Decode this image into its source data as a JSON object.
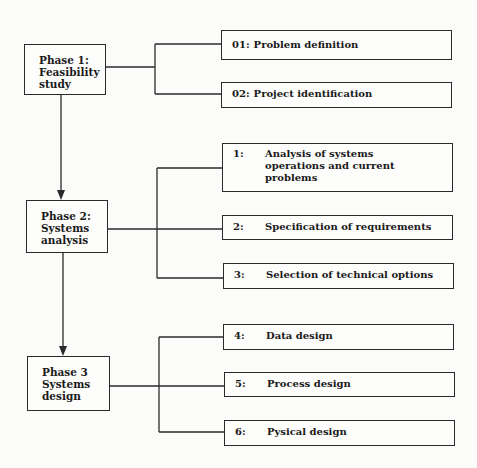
{
  "phases": [
    {
      "id": "phase1",
      "lines": [
        "Phase 1:",
        "Feasibility",
        "study"
      ]
    },
    {
      "id": "phase2",
      "lines": [
        "Phase 2:",
        "Systems",
        "analysis"
      ]
    },
    {
      "id": "phase3",
      "lines": [
        "Phase 3",
        "Systems",
        "design"
      ]
    }
  ],
  "steps": [
    {
      "num": "01:",
      "label": "Problem definition",
      "phase": "phase1"
    },
    {
      "num": "02:",
      "label": "Project identification",
      "phase": "phase1"
    },
    {
      "num": "1:",
      "label": "Analysis of systems\noperations and current\nproblems",
      "phase": "phase2"
    },
    {
      "num": "2:",
      "label": "Specification of requirements",
      "phase": "phase2"
    },
    {
      "num": "3:",
      "label": "Selection of technical options",
      "phase": "phase2"
    },
    {
      "num": "4:",
      "label": "Data design",
      "phase": "phase3"
    },
    {
      "num": "5:",
      "label": "Process design",
      "phase": "phase3"
    },
    {
      "num": "6:",
      "label": "Pysical design",
      "phase": "phase3"
    }
  ],
  "colors": {
    "line": "#2a2a2a",
    "background": "#fbfbf9"
  }
}
